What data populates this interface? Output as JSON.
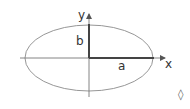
{
  "diagram": {
    "title": "",
    "type": "ellipse-axes",
    "ellipse": {
      "cx": 89,
      "cy": 58,
      "rx": 64,
      "ry": 33,
      "stroke": "#888888"
    },
    "axes": {
      "x_label": "x",
      "y_label": "y",
      "stroke": "#666666"
    },
    "semi_axes": {
      "major_label": "a",
      "minor_label": "b",
      "stroke": "#444444"
    },
    "corner_symbol": "◊"
  }
}
